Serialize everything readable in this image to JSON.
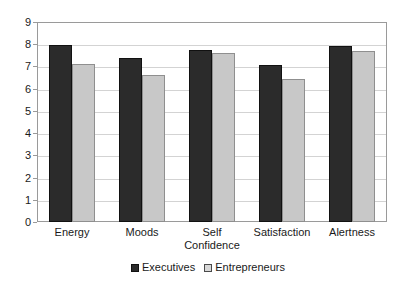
{
  "chart_data": {
    "type": "bar",
    "title": "",
    "subtitle": "",
    "xlabel": "",
    "ylabel": "",
    "categories": [
      "Energy",
      "Moods",
      "Self\nConfidence",
      "Satisfaction",
      "Alertness"
    ],
    "series": [
      {
        "name": "Executives",
        "color": "#2b2b2b",
        "values": [
          7.95,
          7.4,
          7.75,
          7.05,
          7.9
        ]
      },
      {
        "name": "Entrepreneurs",
        "color": "#c8c8c8",
        "values": [
          7.1,
          6.6,
          7.6,
          6.45,
          7.7
        ]
      }
    ],
    "ylim": [
      0,
      9
    ],
    "y_ticks": [
      "0",
      "1",
      "2",
      "3",
      "4",
      "5",
      "6",
      "7",
      "8",
      "9"
    ],
    "grid": true,
    "legend_position": "bottom"
  },
  "legend": {
    "items": [
      {
        "label": "Executives",
        "swatch": "dark-square-swatch"
      },
      {
        "label": "Entrepreneurs",
        "swatch": "light-square-swatch"
      }
    ]
  },
  "colors": {
    "executives": "#2b2b2b",
    "entrepreneurs": "#c8c8c8",
    "gridline": "#d3d3d3",
    "frame": "#9a9a9a",
    "background": "#ffffff",
    "text": "#1a1a1a"
  }
}
